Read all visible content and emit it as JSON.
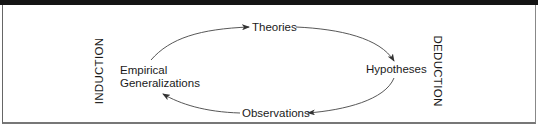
{
  "diagram": {
    "nodes": {
      "theories": "Theories",
      "hypotheses": "Hypotheses",
      "observations": "Observations",
      "empirical_line1": "Empirical",
      "empirical_line2": "Generalizations"
    },
    "side_labels": {
      "left": "INDUCTION",
      "right": "DEDUCTION"
    },
    "edges": [
      {
        "from": "Empirical Generalizations",
        "to": "Theories"
      },
      {
        "from": "Theories",
        "to": "Hypotheses"
      },
      {
        "from": "Hypotheses",
        "to": "Observations"
      },
      {
        "from": "Observations",
        "to": "Empirical Generalizations"
      }
    ],
    "colors": {
      "line": "#333333",
      "bar": "#141414"
    }
  }
}
